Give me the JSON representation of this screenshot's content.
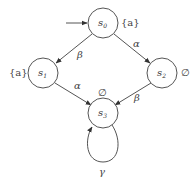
{
  "diagram": {
    "type": "labeled transition system",
    "initial_state": "s0",
    "states": [
      {
        "id": "s0",
        "name": "s",
        "sub": "0",
        "label": "{a}",
        "cx": 103,
        "cy": 23,
        "r": 15
      },
      {
        "id": "s1",
        "name": "s",
        "sub": "1",
        "label": "{a}",
        "cx": 43,
        "cy": 73,
        "r": 15
      },
      {
        "id": "s2",
        "name": "s",
        "sub": "2",
        "label": "∅",
        "cx": 162,
        "cy": 73,
        "r": 15
      },
      {
        "id": "s3",
        "name": "s",
        "sub": "3",
        "label": "∅",
        "cx": 103,
        "cy": 113,
        "r": 15
      }
    ],
    "transitions": [
      {
        "from": "s0",
        "to": "s1",
        "action": "β"
      },
      {
        "from": "s0",
        "to": "s2",
        "action": "α"
      },
      {
        "from": "s1",
        "to": "s3",
        "action": "α"
      },
      {
        "from": "s2",
        "to": "s3",
        "action": "β"
      },
      {
        "from": "s3",
        "to": "s3",
        "action": "γ"
      }
    ],
    "colors": {
      "stroke": "#555555",
      "text": "#333333",
      "background": "#ffffff"
    }
  }
}
